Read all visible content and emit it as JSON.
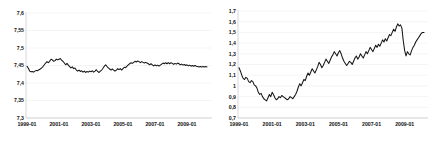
{
  "chart_data": [
    {
      "type": "line",
      "panel": "left",
      "title": "",
      "xlabel": "",
      "ylabel": "",
      "grid": true,
      "legend": null,
      "ylim": [
        7.3,
        7.6
      ],
      "yticks": [
        7.3,
        7.35,
        7.4,
        7.45,
        7.5,
        7.55,
        7.6
      ],
      "ytick_labels": [
        "7,3",
        "7,35",
        "7,4",
        "7,45",
        "7,5",
        "7,55",
        "7,6"
      ],
      "xlim": [
        "1999-01",
        "2010-06"
      ],
      "xticks": [
        "1999-01",
        "2001-01",
        "2003-01",
        "2005-01",
        "2007-01",
        "2009-01"
      ],
      "xtick_labels": [
        "1999-01",
        "2001-01",
        "2003-01",
        "2005-01",
        "2007-01",
        "2009-01"
      ],
      "series": [
        {
          "name": "series-1",
          "color": "#151515",
          "x": [
            "1999-01",
            "1999-02",
            "1999-03",
            "1999-04",
            "1999-05",
            "1999-06",
            "1999-07",
            "1999-08",
            "1999-09",
            "1999-10",
            "1999-11",
            "1999-12",
            "2000-01",
            "2000-02",
            "2000-03",
            "2000-04",
            "2000-05",
            "2000-06",
            "2000-07",
            "2000-08",
            "2000-09",
            "2000-10",
            "2000-11",
            "2000-12",
            "2001-01",
            "2001-02",
            "2001-03",
            "2001-04",
            "2001-05",
            "2001-06",
            "2001-07",
            "2001-08",
            "2001-09",
            "2001-10",
            "2001-11",
            "2001-12",
            "2002-01",
            "2002-02",
            "2002-03",
            "2002-04",
            "2002-05",
            "2002-06",
            "2002-07",
            "2002-08",
            "2002-09",
            "2002-10",
            "2002-11",
            "2002-12",
            "2003-01",
            "2003-02",
            "2003-03",
            "2003-04",
            "2003-05",
            "2003-06",
            "2003-07",
            "2003-08",
            "2003-09",
            "2003-10",
            "2003-11",
            "2003-12",
            "2004-01",
            "2004-02",
            "2004-03",
            "2004-04",
            "2004-05",
            "2004-06",
            "2004-07",
            "2004-08",
            "2004-09",
            "2004-10",
            "2004-11",
            "2004-12",
            "2005-01",
            "2005-02",
            "2005-03",
            "2005-04",
            "2005-05",
            "2005-06",
            "2005-07",
            "2005-08",
            "2005-09",
            "2005-10",
            "2005-11",
            "2005-12",
            "2006-01",
            "2006-02",
            "2006-03",
            "2006-04",
            "2006-05",
            "2006-06",
            "2006-07",
            "2006-08",
            "2006-09",
            "2006-10",
            "2006-11",
            "2006-12",
            "2007-01",
            "2007-02",
            "2007-03",
            "2007-04",
            "2007-05",
            "2007-06",
            "2007-07",
            "2007-08",
            "2007-09",
            "2007-10",
            "2007-11",
            "2007-12",
            "2008-01",
            "2008-02",
            "2008-03",
            "2008-04",
            "2008-05",
            "2008-06",
            "2008-07",
            "2008-08",
            "2008-09",
            "2008-10",
            "2008-11",
            "2008-12",
            "2009-01",
            "2009-02",
            "2009-03",
            "2009-04",
            "2009-05",
            "2009-06",
            "2009-07",
            "2009-08",
            "2009-09",
            "2009-10",
            "2009-11",
            "2009-12",
            "2010-01",
            "2010-02",
            "2010-03",
            "2010-04",
            "2010-05",
            "2010-06"
          ],
          "values": [
            7.448,
            7.442,
            7.434,
            7.432,
            7.433,
            7.431,
            7.434,
            7.436,
            7.435,
            7.438,
            7.44,
            7.443,
            7.447,
            7.452,
            7.457,
            7.461,
            7.458,
            7.462,
            7.468,
            7.466,
            7.462,
            7.464,
            7.468,
            7.466,
            7.468,
            7.47,
            7.465,
            7.462,
            7.457,
            7.452,
            7.456,
            7.451,
            7.447,
            7.443,
            7.446,
            7.441,
            7.443,
            7.437,
            7.434,
            7.437,
            7.433,
            7.435,
            7.431,
            7.434,
            7.43,
            7.433,
            7.431,
            7.434,
            7.432,
            7.435,
            7.431,
            7.434,
            7.438,
            7.433,
            7.43,
            7.434,
            7.437,
            7.442,
            7.448,
            7.452,
            7.447,
            7.443,
            7.44,
            7.437,
            7.44,
            7.437,
            7.434,
            7.437,
            7.441,
            7.438,
            7.441,
            7.437,
            7.441,
            7.445,
            7.444,
            7.448,
            7.452,
            7.455,
            7.458,
            7.456,
            7.459,
            7.462,
            7.46,
            7.463,
            7.461,
            7.458,
            7.461,
            7.459,
            7.457,
            7.459,
            7.457,
            7.455,
            7.452,
            7.455,
            7.452,
            7.449,
            7.452,
            7.449,
            7.451,
            7.448,
            7.451,
            7.454,
            7.457,
            7.455,
            7.458,
            7.455,
            7.458,
            7.455,
            7.458,
            7.456,
            7.453,
            7.456,
            7.454,
            7.457,
            7.455,
            7.452,
            7.454,
            7.451,
            7.453,
            7.45,
            7.452,
            7.449,
            7.451,
            7.448,
            7.45,
            7.448,
            7.45,
            7.448,
            7.447,
            7.446,
            7.447,
            7.446,
            7.447,
            7.446,
            7.447,
            7.446
          ]
        }
      ]
    },
    {
      "type": "line",
      "panel": "right",
      "title": "",
      "xlabel": "",
      "ylabel": "",
      "grid": true,
      "legend": null,
      "ylim": [
        0.7,
        1.7
      ],
      "yticks": [
        0.7,
        0.8,
        0.9,
        1.0,
        1.1,
        1.2,
        1.3,
        1.4,
        1.5,
        1.6,
        1.7
      ],
      "ytick_labels": [
        "0,7",
        "0,8",
        "0,9",
        "1",
        "1,1",
        "1,2",
        "1,3",
        "1,4",
        "1,5",
        "1,6",
        "1,7"
      ],
      "xlim": [
        "1999-01",
        "2010-06"
      ],
      "xticks": [
        "1999-01",
        "2001-01",
        "2003-01",
        "2005-01",
        "2007-01",
        "2009-01"
      ],
      "xtick_labels": [
        "1999-01",
        "2001-01",
        "2003-01",
        "2005-01",
        "2007-01",
        "2009-01"
      ],
      "series": [
        {
          "name": "series-1",
          "color": "#151515",
          "x": [
            "1999-01",
            "1999-02",
            "1999-03",
            "1999-04",
            "1999-05",
            "1999-06",
            "1999-07",
            "1999-08",
            "1999-09",
            "1999-10",
            "1999-11",
            "1999-12",
            "2000-01",
            "2000-02",
            "2000-03",
            "2000-04",
            "2000-05",
            "2000-06",
            "2000-07",
            "2000-08",
            "2000-09",
            "2000-10",
            "2000-11",
            "2000-12",
            "2001-01",
            "2001-02",
            "2001-03",
            "2001-04",
            "2001-05",
            "2001-06",
            "2001-07",
            "2001-08",
            "2001-09",
            "2001-10",
            "2001-11",
            "2001-12",
            "2002-01",
            "2002-02",
            "2002-03",
            "2002-04",
            "2002-05",
            "2002-06",
            "2002-07",
            "2002-08",
            "2002-09",
            "2002-10",
            "2002-11",
            "2002-12",
            "2003-01",
            "2003-02",
            "2003-03",
            "2003-04",
            "2003-05",
            "2003-06",
            "2003-07",
            "2003-08",
            "2003-09",
            "2003-10",
            "2003-11",
            "2003-12",
            "2004-01",
            "2004-02",
            "2004-03",
            "2004-04",
            "2004-05",
            "2004-06",
            "2004-07",
            "2004-08",
            "2004-09",
            "2004-10",
            "2004-11",
            "2004-12",
            "2005-01",
            "2005-02",
            "2005-03",
            "2005-04",
            "2005-05",
            "2005-06",
            "2005-07",
            "2005-08",
            "2005-09",
            "2005-10",
            "2005-11",
            "2005-12",
            "2006-01",
            "2006-02",
            "2006-03",
            "2006-04",
            "2006-05",
            "2006-06",
            "2006-07",
            "2006-08",
            "2006-09",
            "2006-10",
            "2006-11",
            "2006-12",
            "2007-01",
            "2007-02",
            "2007-03",
            "2007-04",
            "2007-05",
            "2007-06",
            "2007-07",
            "2007-08",
            "2007-09",
            "2007-10",
            "2007-11",
            "2007-12",
            "2008-01",
            "2008-02",
            "2008-03",
            "2008-04",
            "2008-05",
            "2008-06",
            "2008-07",
            "2008-08",
            "2008-09",
            "2008-10",
            "2008-11",
            "2008-12",
            "2009-01",
            "2009-02",
            "2009-03",
            "2009-04",
            "2009-05",
            "2009-06",
            "2009-07",
            "2009-08",
            "2009-09",
            "2009-10",
            "2009-11",
            "2009-12",
            "2010-01",
            "2010-02",
            "2010-03",
            "2010-04",
            "2010-05",
            "2010-06"
          ],
          "values": [
            1.17,
            1.14,
            1.1,
            1.07,
            1.06,
            1.08,
            1.07,
            1.04,
            1.03,
            1.05,
            1.04,
            1.01,
            1.0,
            0.98,
            0.94,
            0.92,
            0.93,
            0.9,
            0.88,
            0.87,
            0.86,
            0.89,
            0.92,
            0.9,
            0.94,
            0.92,
            0.89,
            0.87,
            0.88,
            0.9,
            0.89,
            0.91,
            0.9,
            0.89,
            0.88,
            0.87,
            0.88,
            0.9,
            0.89,
            0.88,
            0.9,
            0.92,
            0.95,
            0.99,
            1.02,
            1.0,
            1.03,
            1.06,
            1.05,
            1.09,
            1.12,
            1.1,
            1.13,
            1.16,
            1.14,
            1.12,
            1.15,
            1.18,
            1.22,
            1.2,
            1.17,
            1.19,
            1.22,
            1.25,
            1.23,
            1.21,
            1.24,
            1.27,
            1.29,
            1.32,
            1.3,
            1.28,
            1.31,
            1.33,
            1.3,
            1.26,
            1.23,
            1.21,
            1.19,
            1.21,
            1.23,
            1.22,
            1.2,
            1.23,
            1.26,
            1.28,
            1.25,
            1.27,
            1.3,
            1.28,
            1.26,
            1.29,
            1.32,
            1.3,
            1.33,
            1.36,
            1.34,
            1.32,
            1.35,
            1.38,
            1.36,
            1.39,
            1.37,
            1.4,
            1.43,
            1.41,
            1.44,
            1.42,
            1.45,
            1.48,
            1.47,
            1.5,
            1.53,
            1.51,
            1.55,
            1.58,
            1.56,
            1.57,
            1.54,
            1.42,
            1.33,
            1.28,
            1.32,
            1.3,
            1.29,
            1.33,
            1.36,
            1.38,
            1.41,
            1.43,
            1.45,
            1.47,
            1.49,
            1.5,
            1.5
          ]
        }
      ]
    }
  ]
}
